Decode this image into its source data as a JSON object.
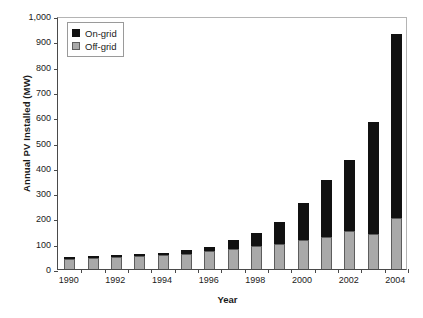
{
  "chart_data": {
    "type": "bar",
    "subtype": "stacked-bar",
    "title": "",
    "xlabel": "Year",
    "ylabel": "Annual PV Installed (MW)",
    "categories": [
      "1990",
      "1991",
      "1992",
      "1993",
      "1994",
      "1995",
      "1996",
      "1997",
      "1998",
      "1999",
      "2000",
      "2001",
      "2002",
      "2003",
      "2004"
    ],
    "x_tick_labels": [
      "1990",
      "1992",
      "1994",
      "1996",
      "1998",
      "2000",
      "2002",
      "2004"
    ],
    "y_tick_labels": [
      "0",
      "100",
      "200",
      "300",
      "400",
      "500",
      "600",
      "700",
      "800",
      "900",
      "1,000"
    ],
    "ylim": [
      0,
      1000
    ],
    "y_tick_step": 100,
    "grid": false,
    "legend_position": "top-left",
    "series": [
      {
        "name": "Off-grid",
        "color": "#a9a9a9",
        "values": [
          40,
          44,
          48,
          52,
          55,
          60,
          72,
          80,
          92,
          98,
          113,
          127,
          151,
          139,
          201
        ]
      },
      {
        "name": "On-grid",
        "color": "#111111",
        "values": [
          5,
          4,
          5,
          7,
          6,
          16,
          17,
          34,
          52,
          86,
          148,
          224,
          280,
          441,
          729
        ]
      }
    ],
    "totals": [
      45,
      48,
      53,
      59,
      61,
      76,
      89,
      114,
      144,
      184,
      261,
      351,
      431,
      580,
      930
    ]
  },
  "legend": {
    "items": [
      {
        "label": "On-grid",
        "color": "#111111"
      },
      {
        "label": "Off-grid",
        "color": "#a9a9a9"
      }
    ]
  }
}
